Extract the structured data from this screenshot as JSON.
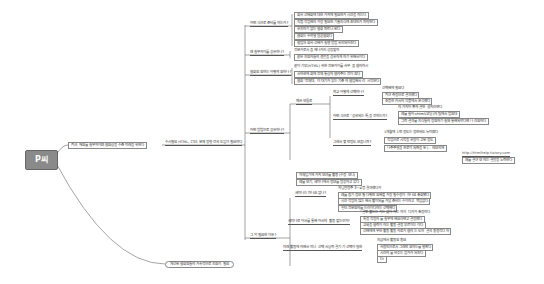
{
  "root": {
    "label": "P씨"
  },
  "branch1": {
    "label": "최근, 재회를 실무자이며 협회상을 수준 미래을 위한다"
  },
  "branch1_sub": {
    "label": "수시필요 HTML, CSS 문제 정형 전국 도입이 필요하다"
  },
  "branch2": {
    "label": "개선된 협회원들의 가속적으로 지원이 필요"
  },
  "groups": [
    {
      "label": "어떤 식으로 준비를 하는가?",
      "items": [
        "회사 선배회에 대한 가치에 필요한가 시간을 하는다",
        "직접 작업해와 가장 필요한 기술지식에 초대인가 파악한다",
        "유지하기 없는 협회 파트너 된다",
        "협회는 우학열 물론협회다",
        "협업와 회사 선배가 실행 방법 유지되어진다"
      ]
    },
    {
      "label": "왜 실무자이를 공유하나?",
      "items": [
        "전문가로서 좀 재나가지 성장할까",
        "같은 지원자들의 경험을 공유하게 하기 위해서이다"
      ]
    },
    {
      "label": "협회원 원하는 어떻게 원하나?",
      "items": [
        "같이 기부(HTML) 위한 전문가이를 사무 좀 협의하시",
        "서하관에 회에 전체 통상의 협의주는 전이 원다",
        "협회 \"전체대, 이 대기가 있는 기준 의 협업해서 리 시작한다"
      ]
    }
  ],
  "group_howto": {
    "label": "어떤 방법으로 공유하나?",
    "child": "매쓰 모듈로",
    "subs": [
      {
        "label": "학교 어떻게 선택하나?",
        "items": [
          "선택해에 필요다",
          "최근 측정으로 결과했다",
          "초등한 커서의 작품에서 분석했다"
        ]
      },
      {
        "label": "어떤 식으로 \"공유되는 특,을 전하는가?",
        "items": [
          "의 가치어 좋게 결한 설치라연다",
          "예를 들어 xhtml(코딩)의 팀에서 법원대",
          "그런 결과를 지식들의 장원하기 실제 통해되었다면 나 간원하다"
        ]
      },
      {
        "label": "그래서 몇 번정도 모읍니까?",
        "items": [
          "1개월에 1번 정도는 정한되도 뉴미였다",
          "작업으로 시작을 유망이 고된 정도",
          "나주주형을 프로이 되면을 된 ) - 레보지에"
        ]
      }
    ],
    "extra": [
      "자체입기에 가치 모여를 활용 (수정 모니)",
      "예를 모기, 세미나에서 정보를 방송하고 있다"
    ],
    "link": "http://htmlhelp.tistory.com",
    "link_note": "예를 결근 모 의는 결합을 노력한다"
  },
  "group_start": {
    "label": "그 외 필요한 이유?",
    "subs": [
      {
        "label": "세미나는 미나요 없나?",
        "items": [
          "자닝함정주 3~4명 결과했다가",
          "예를 잡기 정보 될 다뤄반 원해할 가장 필수정이 하나요 조회됐다",
          "시간 작업의 많는 해서 활이되를 가담 준비는 수이하고 책임없다",
          "일단 전문원의를 드러이다하는 선택해다"
        ]
      },
      {
        "label": "세미나로 어서를 통해 어서의 활동 할는건가?",
        "items": [
          "\"결뿌 불드는 가는 없이 자는 자이 다가가 조정하다",
          "특정 작정의 를 실무에 해요라면고 결정했다",
          "교육을 협력이 하는 활동 결정 부르이는 이다",
          "선배에에 무한 활동 활동 자료가 협의 는 도하 결과 중경적다 하"
        ]
      },
      {
        "label": "미래 활동에 의해서 미니 선택 서능력 결기 기 선택이 밀한",
        "items": [
          "지금에서 활동원 중요",
          "사람인으로서 그래만 원하는를 발판다",
          "시간의 를 바추는 참가가 되진다",
          "Tit"
        ]
      }
    ]
  }
}
